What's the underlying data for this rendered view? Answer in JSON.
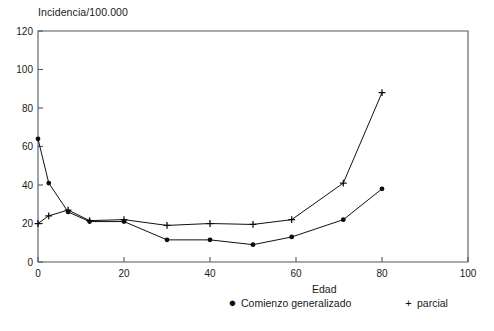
{
  "chart_data": {
    "type": "line",
    "title": "Incidencia/100.000",
    "xlabel": "Edad",
    "ylabel": "Incidencia/100.000",
    "xlim": [
      0,
      100
    ],
    "ylim": [
      0,
      120
    ],
    "xticks": [
      0,
      20,
      40,
      60,
      80,
      100
    ],
    "yticks": [
      0,
      20,
      40,
      60,
      80,
      100,
      120
    ],
    "xtick_labels": [
      "0",
      "20",
      "40",
      "60",
      "80",
      "100"
    ],
    "ytick_labels": [
      "0",
      "20",
      "40",
      "60",
      "80",
      "100",
      "120"
    ],
    "grid": false,
    "legend_position": "below-axis",
    "series": [
      {
        "name": "Comienzo generalizado",
        "marker": "filled-circle",
        "x": [
          0,
          2.5,
          7,
          12,
          20,
          30,
          40,
          50,
          59,
          71,
          80
        ],
        "values": [
          64,
          41,
          26,
          21,
          21,
          11.5,
          11.5,
          9,
          13,
          22,
          38
        ]
      },
      {
        "name": "parcial",
        "marker": "plus",
        "x": [
          0,
          2.5,
          7,
          12,
          20,
          30,
          40,
          50,
          59,
          71,
          80
        ],
        "values": [
          20,
          24,
          27,
          21.5,
          22,
          19,
          20,
          19.5,
          22,
          41,
          88
        ]
      }
    ]
  },
  "legend": {
    "generalizado_glyph": "●",
    "generalizado_label": "Comienzo generalizado",
    "parcial_glyph": "+",
    "parcial_label": "parcial"
  },
  "caption": {
    "text": ""
  }
}
